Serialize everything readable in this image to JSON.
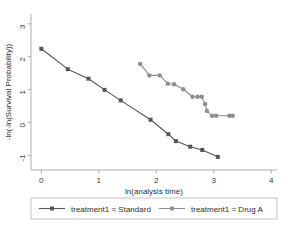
{
  "chart_data": {
    "type": "line",
    "title": "",
    "xlabel": "ln(analysis time)",
    "ylabel": "-ln(-ln(Survival Probability))",
    "xlim": [
      -0.18,
      4.1
    ],
    "ylim": [
      -1.45,
      3.3
    ],
    "xticks": [
      "0",
      "1",
      "2",
      "3",
      "4"
    ],
    "xtick_values": [
      0,
      1,
      2,
      3,
      4
    ],
    "yticks": [
      "3",
      "2",
      "1",
      "0",
      "-1"
    ],
    "ytick_values": [
      3,
      2,
      1,
      0,
      -1
    ],
    "grid": false,
    "legend_position": "bottom",
    "series": [
      {
        "name": "treatment1 = Standard",
        "color": "#555555",
        "marker": "square",
        "points": [
          [
            0.0,
            2.24
          ],
          [
            0.46,
            1.62
          ],
          [
            0.82,
            1.33
          ],
          [
            1.1,
            0.99
          ],
          [
            1.38,
            0.67
          ],
          [
            1.9,
            0.08
          ],
          [
            2.21,
            -0.36
          ],
          [
            2.34,
            -0.57
          ],
          [
            2.59,
            -0.74
          ],
          [
            2.8,
            -0.84
          ],
          [
            3.07,
            -1.05
          ]
        ]
      },
      {
        "name": "treatment1 = Drug A",
        "color": "#8d8d8d",
        "marker": "circle",
        "points": [
          [
            1.72,
            1.78
          ],
          [
            1.88,
            1.43
          ],
          [
            2.06,
            1.43
          ],
          [
            2.2,
            1.18
          ],
          [
            2.31,
            1.16
          ],
          [
            2.47,
            1.01
          ],
          [
            2.63,
            0.78
          ],
          [
            2.72,
            0.78
          ],
          [
            2.79,
            0.78
          ],
          [
            2.85,
            0.56
          ],
          [
            2.88,
            0.35
          ],
          [
            2.97,
            0.2
          ],
          [
            3.04,
            0.2
          ],
          [
            3.27,
            0.2
          ],
          [
            3.33,
            0.2
          ]
        ]
      }
    ]
  },
  "legend": {
    "items": [
      {
        "label": "treatment1 = Standard",
        "color": "#555555",
        "marker": "square"
      },
      {
        "label": "treatment1 = Drug A",
        "color": "#8d8d8d",
        "marker": "circle"
      }
    ]
  }
}
